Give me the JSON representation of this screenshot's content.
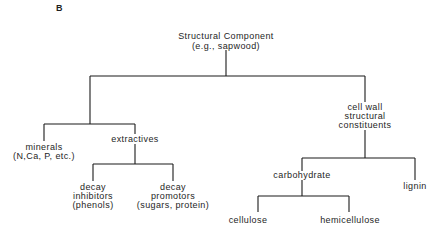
{
  "panel_label": "B",
  "nodes": {
    "root": {
      "lines": [
        "Structural Component",
        "(e.g., sapwood)"
      ]
    },
    "minerals": {
      "lines": [
        "minerals",
        "(N,Ca, P, etc.)"
      ]
    },
    "extractives": {
      "lines": [
        "extractives"
      ]
    },
    "decay_inhibitors": {
      "lines": [
        "decay",
        "inhibitors",
        "(phenols)"
      ]
    },
    "decay_promotors": {
      "lines": [
        "decay",
        "promotors",
        "(sugars, protein)"
      ]
    },
    "cell_wall": {
      "lines": [
        "cell wall",
        "structural",
        "constituents"
      ]
    },
    "carbohydrate": {
      "lines": [
        "carbohydrate"
      ]
    },
    "lignin": {
      "lines": [
        "lignin"
      ]
    },
    "cellulose": {
      "lines": [
        "cellulose"
      ]
    },
    "hemicellulose": {
      "lines": [
        "hemicellulose"
      ]
    }
  },
  "edges": [
    [
      "root",
      "minerals"
    ],
    [
      "root",
      "extractives"
    ],
    [
      "root",
      "cell_wall"
    ],
    [
      "extractives",
      "decay_inhibitors"
    ],
    [
      "extractives",
      "decay_promotors"
    ],
    [
      "cell_wall",
      "carbohydrate"
    ],
    [
      "cell_wall",
      "lignin"
    ],
    [
      "carbohydrate",
      "cellulose"
    ],
    [
      "carbohydrate",
      "hemicellulose"
    ]
  ],
  "colors": {
    "line": "#1a1a1a",
    "text": "#1e1e1e",
    "background": "#ffffff"
  }
}
